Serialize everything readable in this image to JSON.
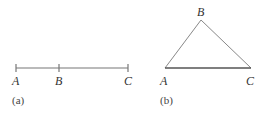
{
  "figure_a": {
    "caption": "(a)",
    "points": [
      {
        "label": "A",
        "x": 16,
        "y": 68
      },
      {
        "label": "B",
        "x": 59,
        "y": 68
      },
      {
        "label": "C",
        "x": 128,
        "y": 68
      }
    ]
  },
  "figure_b": {
    "caption": "(b)",
    "points": [
      {
        "label": "A",
        "x": 165,
        "y": 68
      },
      {
        "label": "B",
        "x": 201,
        "y": 20
      },
      {
        "label": "C",
        "x": 251,
        "y": 68
      }
    ]
  },
  "colors": {
    "line": "#777777",
    "text": "#333333"
  }
}
